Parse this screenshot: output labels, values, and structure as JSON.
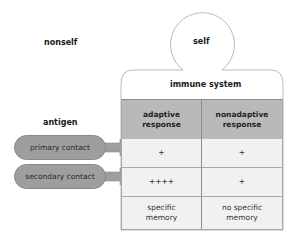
{
  "labels": {
    "nonself": "nonself",
    "self": "self",
    "antigen": "antigen",
    "immune_system": "immune system"
  },
  "table": {
    "columns": [
      {
        "line1": "adaptive",
        "line2": "response"
      },
      {
        "line1": "nonadaptive",
        "line2": "response"
      }
    ],
    "rows": [
      {
        "label": "primary contact",
        "cells": [
          "+",
          "+"
        ]
      },
      {
        "label": "secondary contact",
        "cells": [
          "++++",
          "+"
        ]
      },
      {
        "label": "",
        "cells": [
          {
            "line1": "specific",
            "line2": "memory"
          },
          {
            "line1": "no specific",
            "line2": "memory"
          }
        ]
      }
    ]
  },
  "colors": {
    "header_fill": "#b9b9b9",
    "cell_fill": "#f1f1f1",
    "pill_fill": "#9e9e9e",
    "outline": "#8c8c8c"
  }
}
